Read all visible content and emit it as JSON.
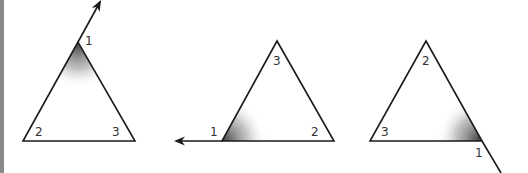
{
  "figure": {
    "colors": {
      "stroke": "#1a1a1a",
      "label": "#333333",
      "shade_dark": "#555555",
      "left_rule": "#8a8a8a"
    },
    "triangles": [
      {
        "id": "triangle-a",
        "labels": [
          {
            "text": "1",
            "x": 88,
            "y": 45
          },
          {
            "text": "2",
            "x": 35,
            "y": 136
          },
          {
            "text": "3",
            "x": 112,
            "y": 136
          }
        ],
        "shaded_vertex": "1",
        "extension": "arrow up-right from top vertex"
      },
      {
        "id": "triangle-b",
        "labels": [
          {
            "text": "3",
            "x": 273,
            "y": 65
          },
          {
            "text": "1",
            "x": 210,
            "y": 136
          },
          {
            "text": "2",
            "x": 311,
            "y": 136
          }
        ],
        "shaded_vertex": "1",
        "extension": "arrow left from bottom-left vertex"
      },
      {
        "id": "triangle-c",
        "labels": [
          {
            "text": "2",
            "x": 422,
            "y": 65
          },
          {
            "text": "3",
            "x": 381,
            "y": 136
          },
          {
            "text": "1",
            "x": 475,
            "y": 156
          }
        ],
        "shaded_vertex": "1",
        "extension": "line down-right from bottom-right vertex"
      }
    ]
  }
}
